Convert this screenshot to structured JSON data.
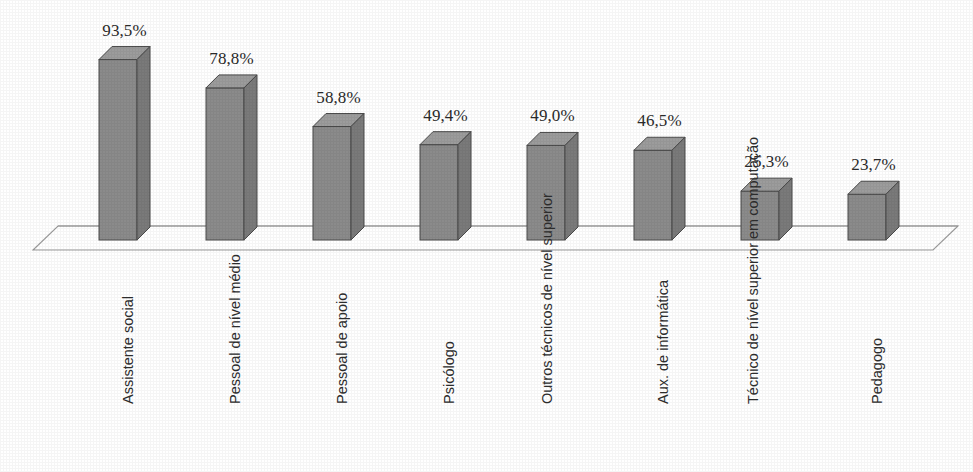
{
  "chart_data": {
    "type": "bar",
    "title": "",
    "subtitle": "",
    "xlabel": "",
    "ylabel": "",
    "grid": false,
    "legend": false,
    "legend_position": "none",
    "value_suffix": "%",
    "decimal_separator": ",",
    "ylim": [
      0,
      100
    ],
    "categories": [
      "Assistente social",
      "Pessoal de nível médio",
      "Pessoal de apoio",
      "Psicólogo",
      "Outros técnicos de nível superior",
      "Aux. de informática",
      "Técnico de nível superior em computação",
      "Pedagogo"
    ],
    "category_lines": [
      [
        "Assistente social"
      ],
      [
        "Pessoal de nível médio"
      ],
      [
        "Pessoal de apoio"
      ],
      [
        "Psicólogo"
      ],
      [
        "Outros técnicos",
        "de nível superior"
      ],
      [
        "Aux. de informática"
      ],
      [
        "Técnico de nível",
        "superior em",
        "computação"
      ],
      [
        "Pedagogo"
      ]
    ],
    "values": [
      93.5,
      78.8,
      58.8,
      49.4,
      49.0,
      46.5,
      25.3,
      23.7
    ],
    "value_labels": [
      "93,5%",
      "78,8%",
      "58,8%",
      "49,4%",
      "49,0%",
      "46,5%",
      "25,3%",
      "23,7%"
    ]
  },
  "style": {
    "bar_front_color": "#8b8b8b",
    "bar_top_color": "#9c9c9c",
    "bar_side_color": "#7a7a7a",
    "bar_edge_color": "#4a4a4a",
    "floor_line_color": "#9a9a9a",
    "background_color": "#ffffff",
    "label_color": "#2b2b2b"
  }
}
